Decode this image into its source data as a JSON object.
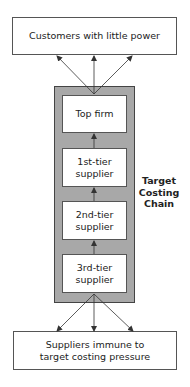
{
  "diagram": {
    "top_box": {
      "label": "Customers with little power"
    },
    "bottom_box": {
      "label": "Suppliers immune to target costing pressure"
    },
    "chain_label": {
      "lines": [
        "Target",
        "Costing",
        "Chain"
      ]
    },
    "tiers": [
      {
        "label": "Top firm"
      },
      {
        "label": "1st-tier supplier"
      },
      {
        "label": "2nd-tier supplier"
      },
      {
        "label": "3rd-tier supplier"
      }
    ],
    "colors": {
      "chain_fill": "#a8a8a8",
      "box_fill": "#ffffff",
      "stroke": "#444444"
    }
  }
}
